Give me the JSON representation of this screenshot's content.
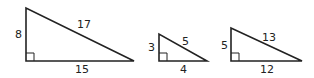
{
  "triangles": [
    {
      "id": "t1",
      "legs": [
        "8",
        "15"
      ],
      "hypotenuse": "17",
      "labels": {
        "vertical": "8",
        "base": "15",
        "hyp": "17"
      }
    },
    {
      "id": "t2",
      "legs": [
        "3",
        "4"
      ],
      "hypotenuse": "5",
      "labels": {
        "vertical": "3",
        "base": "4",
        "hyp": "5"
      }
    },
    {
      "id": "t3",
      "legs": [
        "5",
        "12"
      ],
      "hypotenuse": "13",
      "labels": {
        "vertical": "5",
        "base": "12",
        "hyp": "13"
      }
    }
  ],
  "stroke_color": "#222222"
}
